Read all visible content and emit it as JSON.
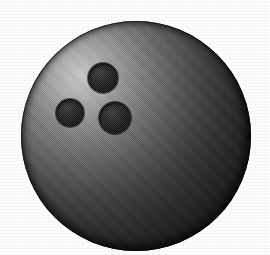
{
  "image": {
    "subject": "bowling-ball",
    "style": "halftone-scanned-clipart",
    "caption": "",
    "width": 270,
    "height": 255,
    "background_color": "#fdfdfb"
  },
  "ball": {
    "label": "bowling ball",
    "center_x": 136,
    "center_y": 136,
    "radius_x": 115,
    "radius_y": 115,
    "highlight_color": "#c9c9c9",
    "midtone_color": "#5d5d5d",
    "shadow_color": "#0c0c0c",
    "outline_color": "#000000",
    "highlight_position": "upper-left",
    "shading": "radial"
  },
  "finger_holes": [
    {
      "label": "top-finger-hole",
      "name": "finger-hole-top",
      "center_x": 103,
      "center_y": 78,
      "radius": 15,
      "color": "#151515"
    },
    {
      "label": "left-finger-hole",
      "name": "finger-hole-left",
      "center_x": 70,
      "center_y": 113,
      "radius": 14,
      "color": "#151515"
    },
    {
      "label": "thumb-hole",
      "name": "finger-hole-thumb",
      "center_x": 115,
      "center_y": 118,
      "radius": 16,
      "color": "#151515"
    }
  ]
}
